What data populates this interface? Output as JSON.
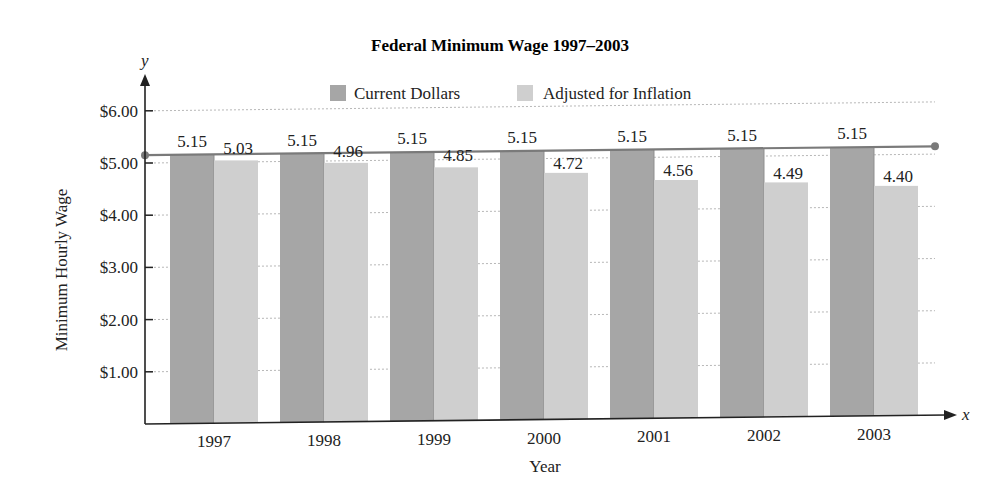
{
  "chart_data": {
    "type": "bar",
    "title": "Federal Minimum Wage 1997–2003",
    "xlabel": "Year",
    "ylabel": "Minimum Hourly Wage",
    "x_axis_letter": "x",
    "y_axis_letter": "y",
    "categories": [
      "1997",
      "1998",
      "1999",
      "2000",
      "2001",
      "2002",
      "2003"
    ],
    "series": [
      {
        "name": "Current Dollars",
        "color": "#a6a6a6",
        "values": [
          5.15,
          5.15,
          5.15,
          5.15,
          5.15,
          5.15,
          5.15
        ],
        "labels": [
          "5.15",
          "5.15",
          "5.15",
          "5.15",
          "5.15",
          "5.15",
          "5.15"
        ]
      },
      {
        "name": "Adjusted for Inflation",
        "color": "#cfcfcf",
        "values": [
          5.03,
          4.96,
          4.85,
          4.72,
          4.56,
          4.49,
          4.4
        ],
        "labels": [
          "5.03",
          "4.96",
          "4.85",
          "4.72",
          "4.56",
          "4.49",
          "4.40"
        ]
      }
    ],
    "yticks": [
      "$1.00",
      "$2.00",
      "$3.00",
      "$4.00",
      "$5.00",
      "$6.00"
    ],
    "ytick_values": [
      1,
      2,
      3,
      4,
      5,
      6
    ],
    "ylim": [
      0,
      6.2
    ],
    "reference_line": {
      "value": 5.15,
      "color": "#7a7a7a"
    },
    "grid": "dotted horizontal",
    "legend_position": "top center"
  }
}
